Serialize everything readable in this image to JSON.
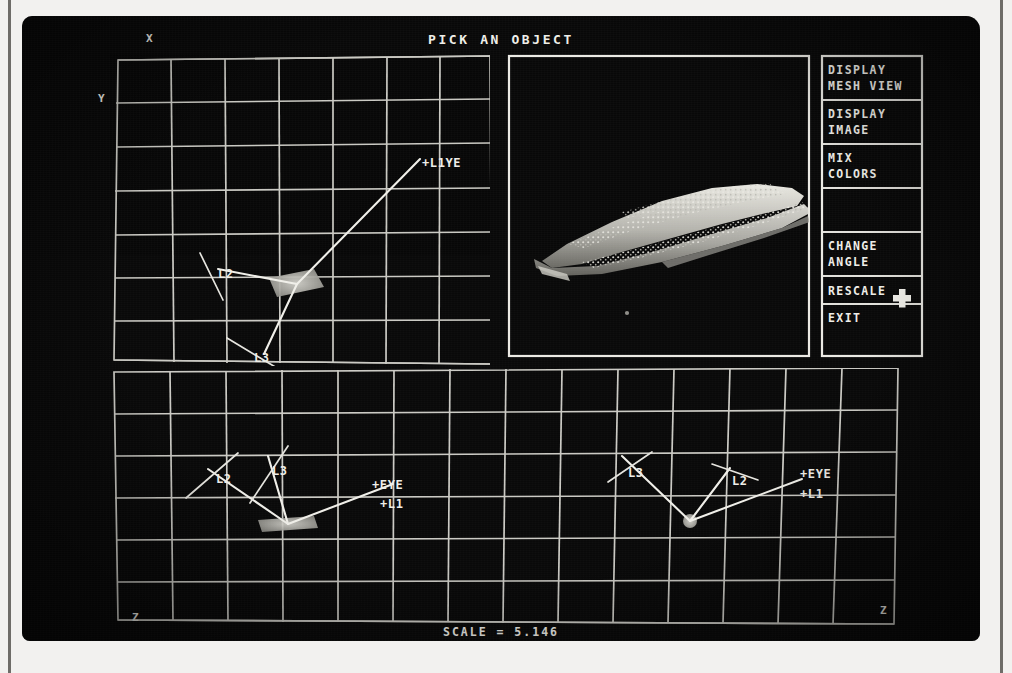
{
  "screen": {
    "title": "PICK AN OBJECT",
    "status": "SCALE = 5.146"
  },
  "menu": {
    "items": [
      {
        "id": "display-mesh-view",
        "line1": "DISPLAY",
        "line2": "MESH VIEW"
      },
      {
        "id": "display-image",
        "line1": "DISPLAY",
        "line2": "IMAGE"
      },
      {
        "id": "mix-colors",
        "line1": "MIX",
        "line2": "COLORS"
      },
      {
        "id": "blank",
        "line1": "",
        "line2": ""
      },
      {
        "id": "change-angle",
        "line1": "CHANGE",
        "line2": "ANGLE"
      },
      {
        "id": "rescale",
        "line1": "RESCALE",
        "line2": ""
      },
      {
        "id": "exit",
        "line1": "EXIT",
        "line2": ""
      }
    ]
  },
  "cursor": {
    "glyph": "+",
    "over": "exit"
  },
  "viewport_top": {
    "axes": {
      "top_left_horizontal": "X",
      "left_vertical": "Y"
    },
    "labels": [
      {
        "text": "+L1YE",
        "x": 400,
        "y": 148
      },
      {
        "text": "L2",
        "x": 196,
        "y": 257
      },
      {
        "text": "L3",
        "x": 232,
        "y": 341
      }
    ]
  },
  "viewport_bottom": {
    "axes": {
      "bottom_left_vertical": "Z",
      "bottom_left_horizontal": "X",
      "bottom_right_vertical": "Z",
      "bottom_right_horizontal": "Y"
    },
    "labels": [
      {
        "text": "L2",
        "x": 202,
        "y": 460
      },
      {
        "text": "L3",
        "x": 256,
        "y": 452
      },
      {
        "text": "+EYE",
        "x": 352,
        "y": 470
      },
      {
        "text": "+L1",
        "x": 360,
        "y": 488
      },
      {
        "text": "L3",
        "x": 612,
        "y": 455
      },
      {
        "text": "L2",
        "x": 713,
        "y": 463
      },
      {
        "text": "+EYE",
        "x": 782,
        "y": 458
      },
      {
        "text": "+L1",
        "x": 782,
        "y": 478
      }
    ]
  },
  "mesh_panel": {
    "object": "car-body-mesh",
    "dot_marker": true
  },
  "colors": {
    "phosphor": "#efeee8",
    "grid": "#dcdbd4",
    "screen_bg": "#090909",
    "page_bg": "#f2f1ef"
  }
}
